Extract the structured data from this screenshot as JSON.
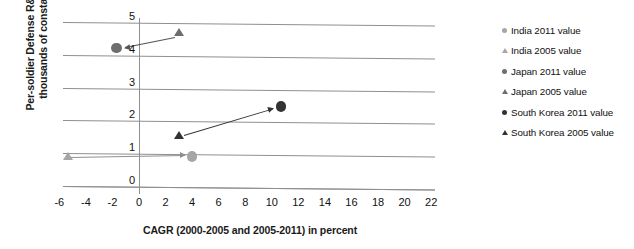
{
  "chart_data": {
    "type": "scatter",
    "title": "",
    "xlabel": "CAGR (2000-2005 and 2005-2011) in percent",
    "ylabel_line1": "Per-soldier Defense R&D spending (in",
    "ylabel_line2": "thousands of constant 2011 US$)",
    "xlim": [
      -6,
      22
    ],
    "ylim": [
      0,
      5
    ],
    "xticks": [
      "-6",
      "-4",
      "-2",
      "0",
      "2",
      "4",
      "6",
      "8",
      "10",
      "12",
      "14",
      "16",
      "18",
      "20",
      "22"
    ],
    "xtick_values": [
      -6,
      -4,
      -2,
      0,
      2,
      4,
      6,
      8,
      10,
      12,
      14,
      16,
      18,
      20,
      22
    ],
    "yticks": [
      "0",
      "1",
      "2",
      "3",
      "4",
      "5"
    ],
    "ytick_values": [
      0,
      1,
      2,
      3,
      4,
      5
    ],
    "grid": "horizontal",
    "legend_position": "right",
    "series": [
      {
        "name": "India 2011 value",
        "marker": "circle",
        "color": "#a6a6a6",
        "points": [
          {
            "x": 4.0,
            "y": 0.9
          }
        ]
      },
      {
        "name": "India 2005 value",
        "marker": "triangle",
        "color": "#a6a6a6",
        "points": [
          {
            "x": -5.3,
            "y": 0.85
          }
        ]
      },
      {
        "name": "Japan 2011 value",
        "marker": "circle",
        "color": "#6e6e6e",
        "points": [
          {
            "x": -1.7,
            "y": 4.2
          }
        ]
      },
      {
        "name": "Japan 2005 value",
        "marker": "triangle",
        "color": "#6e6e6e",
        "points": [
          {
            "x": 3.0,
            "y": 4.62
          }
        ]
      },
      {
        "name": "South Korea 2011 value",
        "marker": "circle",
        "color": "#333333",
        "points": [
          {
            "x": 10.7,
            "y": 2.42
          }
        ]
      },
      {
        "name": "South Korea 2005 value",
        "marker": "triangle",
        "color": "#333333",
        "points": [
          {
            "x": 3.0,
            "y": 1.5
          }
        ]
      }
    ],
    "arrows": [
      {
        "name": "india-arrow",
        "from": {
          "x": -5.3,
          "y": 0.87
        },
        "to": {
          "x": 3.4,
          "y": 0.93
        },
        "color": "#8f8f8f"
      },
      {
        "name": "japan-arrow",
        "from": {
          "x": 2.7,
          "y": 4.55
        },
        "to": {
          "x": -1.1,
          "y": 4.24
        },
        "color": "#555555"
      },
      {
        "name": "south-korea-arrow",
        "from": {
          "x": 3.4,
          "y": 1.55
        },
        "to": {
          "x": 10.1,
          "y": 2.36
        },
        "color": "#333333"
      }
    ]
  },
  "legend": {
    "items": [
      {
        "label": "India 2011 value",
        "marker": "circle",
        "color": "#a6a6a6"
      },
      {
        "label": "India 2005 value",
        "marker": "triangle",
        "color": "#a6a6a6"
      },
      {
        "label": "Japan 2011 value",
        "marker": "circle",
        "color": "#6e6e6e"
      },
      {
        "label": "Japan 2005 value",
        "marker": "triangle",
        "color": "#6e6e6e"
      },
      {
        "label": "South Korea 2011 value",
        "marker": "circle",
        "color": "#333333"
      },
      {
        "label": "South Korea 2005 value",
        "marker": "triangle",
        "color": "#333333"
      }
    ]
  }
}
